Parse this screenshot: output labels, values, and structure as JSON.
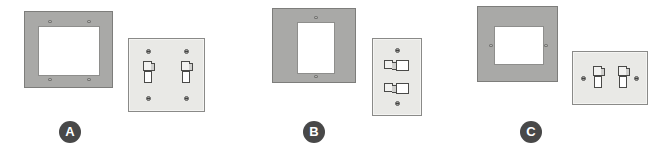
{
  "figure": {
    "background_color": "#ffffff",
    "panels": [
      {
        "id": "a",
        "label": "A",
        "label_shape": "filled-circle",
        "label_color": "#484848",
        "label_text_color": "#ffffff",
        "mount_plate": {
          "name": "two-gang mounting plate",
          "color": "#a9a9a7",
          "opening_shape": "wide rectangle",
          "opening_color": "#ffffff",
          "screw_hole_count": 4,
          "screw_hole_positions": "four corners of opening"
        },
        "cover_plate": {
          "name": "two-gang toggle switch cover plate",
          "color": "#e9e9e6",
          "orientation": "horizontal",
          "toggle_count": 2,
          "toggle_type": "vertical toggle",
          "screw_count": 4,
          "screw_positions": "above and below each toggle"
        }
      },
      {
        "id": "b",
        "label": "B",
        "label_shape": "filled-circle",
        "label_color": "#484848",
        "label_text_color": "#ffffff",
        "mount_plate": {
          "name": "single-gang decorator mounting plate",
          "color": "#a9a9a7",
          "opening_shape": "tall rectangle",
          "opening_color": "#ffffff",
          "screw_hole_count": 2,
          "screw_hole_positions": "top center and bottom center of opening"
        },
        "cover_plate": {
          "name": "single-gang cover plate with stacked horizontal toggles",
          "color": "#e9e9e6",
          "orientation": "vertical",
          "toggle_count": 2,
          "toggle_type": "horizontal toggle",
          "screw_count": 2,
          "screw_positions": "top center and bottom center"
        }
      },
      {
        "id": "c",
        "label": "C",
        "label_shape": "filled-circle",
        "label_color": "#484848",
        "label_text_color": "#ffffff",
        "mount_plate": {
          "name": "wide mounting plate with side screws",
          "color": "#a9a9a7",
          "opening_shape": "wide rectangle",
          "opening_color": "#ffffff",
          "screw_hole_count": 2,
          "screw_hole_positions": "left and right sides of opening"
        },
        "cover_plate": {
          "name": "two-gang toggle cover plate with side screws",
          "color": "#e9e9e6",
          "orientation": "horizontal",
          "toggle_count": 2,
          "toggle_type": "vertical toggle",
          "screw_count": 2,
          "screw_positions": "left and right edges"
        }
      }
    ]
  }
}
